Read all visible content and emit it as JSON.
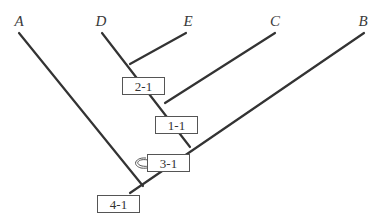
{
  "diagram": {
    "type": "cladogram",
    "line_color": "#333333",
    "taxa": [
      {
        "id": "A",
        "label": "A",
        "x": 19,
        "y": 14
      },
      {
        "id": "D",
        "label": "D",
        "x": 101,
        "y": 14
      },
      {
        "id": "E",
        "label": "E",
        "x": 188,
        "y": 14
      },
      {
        "id": "C",
        "label": "C",
        "x": 275,
        "y": 14
      },
      {
        "id": "B",
        "label": "B",
        "x": 363,
        "y": 14
      }
    ],
    "nodes": [
      {
        "id": "node-2-1",
        "label": "2-1",
        "joins": [
          "D",
          "E"
        ]
      },
      {
        "id": "node-1-1",
        "label": "1-1",
        "joins": [
          "2-1",
          "C"
        ]
      },
      {
        "id": "node-3-1",
        "label": "3-1",
        "joins": [
          "1-1",
          "B"
        ]
      },
      {
        "id": "node-4-1",
        "label": "4-1",
        "joins": [
          "3-1",
          "A"
        ]
      }
    ],
    "boxes": [
      {
        "label": "2-1",
        "x": 122,
        "y": 77,
        "w": 43,
        "h": 18
      },
      {
        "label": "1-1",
        "x": 155,
        "y": 116,
        "w": 43,
        "h": 18
      },
      {
        "label": "3-1",
        "x": 147,
        "y": 154,
        "w": 43,
        "h": 18
      },
      {
        "label": "4-1",
        "x": 97,
        "y": 195,
        "w": 43,
        "h": 18
      }
    ],
    "annotation": {
      "type": "curved-loop-arrow",
      "near": "3-1"
    }
  }
}
